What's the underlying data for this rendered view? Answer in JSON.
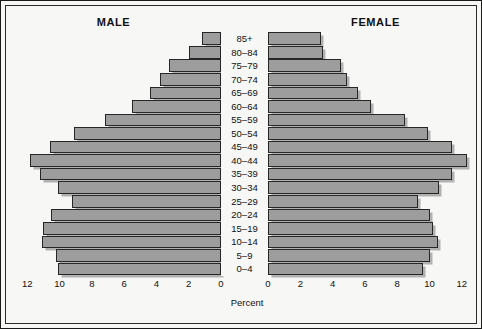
{
  "chart_data": {
    "type": "bar",
    "subtype": "population-pyramid",
    "title": "",
    "xlabel": "Percent",
    "ylabel": "",
    "grid": false,
    "legend_position": "top",
    "xlim": [
      0,
      12
    ],
    "x_ticks_left": [
      "12",
      "10",
      "8",
      "6",
      "4",
      "2",
      "0"
    ],
    "x_ticks_right": [
      "0",
      "2",
      "4",
      "6",
      "8",
      "10",
      "12"
    ],
    "categories": [
      "85+",
      "80–84",
      "75–79",
      "70–74",
      "65–69",
      "60–64",
      "55–59",
      "50–54",
      "45–49",
      "40–44",
      "35–39",
      "30–34",
      "25–29",
      "20–24",
      "15–19",
      "10–14",
      "5–9",
      "0–4"
    ],
    "series": [
      {
        "name": "MALE",
        "side": "left",
        "values": [
          1.2,
          2.0,
          3.2,
          3.8,
          4.4,
          5.5,
          7.2,
          9.1,
          10.6,
          11.8,
          11.2,
          10.1,
          9.2,
          10.5,
          11.0,
          11.1,
          10.2,
          10.1
        ]
      },
      {
        "name": "FEMALE",
        "side": "right",
        "values": [
          3.3,
          3.4,
          4.5,
          4.9,
          5.6,
          6.4,
          8.5,
          9.9,
          11.4,
          12.3,
          11.4,
          10.6,
          9.3,
          10.0,
          10.2,
          10.5,
          10.0,
          9.6
        ]
      }
    ]
  },
  "labels": {
    "male_title": "MALE",
    "female_title": "FEMALE",
    "axis_title": "Percent"
  },
  "colors": {
    "bar_fill": "#9d9d9d",
    "bar_outline": "#262626",
    "background": "#f7f7f6",
    "frame": "#1a1a1a",
    "text": "#111111"
  }
}
